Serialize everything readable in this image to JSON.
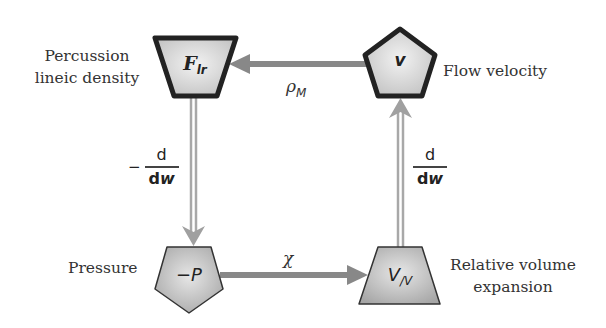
{
  "diagram": {
    "colors": {
      "arrow_gray": "#888888",
      "double_arrow_gray": "#a8a8a8",
      "node_fill": "#d8d8d8",
      "node_fill_dark": "#b5b5b5",
      "node_stroke_bold": "#222222",
      "node_stroke_thin": "#333333"
    },
    "nodes": [
      {
        "id": "force",
        "shape": "trapezoid-inverted",
        "symbol_main": "F",
        "symbol_sub": "lr",
        "label_lines": [
          "Percussion",
          "lineic density"
        ],
        "border": "bold"
      },
      {
        "id": "velocity",
        "shape": "pentagon",
        "symbol_main": "v",
        "symbol_sub": "",
        "label_lines": [
          "Flow velocity"
        ],
        "border": "bold"
      },
      {
        "id": "pressure",
        "shape": "pentagon-inverted",
        "symbol_main": "−P",
        "symbol_sub": "",
        "label_lines": [
          "Pressure"
        ],
        "border": "thin"
      },
      {
        "id": "volume",
        "shape": "trapezoid",
        "symbol_main": "V",
        "symbol_sub": "/V",
        "label_lines": [
          "Relative volume",
          "expansion"
        ],
        "border": "thin"
      }
    ],
    "edges": [
      {
        "from": "velocity",
        "to": "force",
        "style": "single",
        "label_main": "ρ",
        "label_sub": "M"
      },
      {
        "from": "force",
        "to": "pressure",
        "style": "double",
        "label_sign": "−",
        "label_num": "d",
        "label_den_d": "d",
        "label_den_var": "w"
      },
      {
        "from": "pressure",
        "to": "volume",
        "style": "single",
        "label_main": "χ",
        "label_sub": ""
      },
      {
        "from": "volume",
        "to": "velocity",
        "style": "double",
        "label_sign": "",
        "label_num": "d",
        "label_den_d": "d",
        "label_den_var": "w"
      }
    ]
  }
}
